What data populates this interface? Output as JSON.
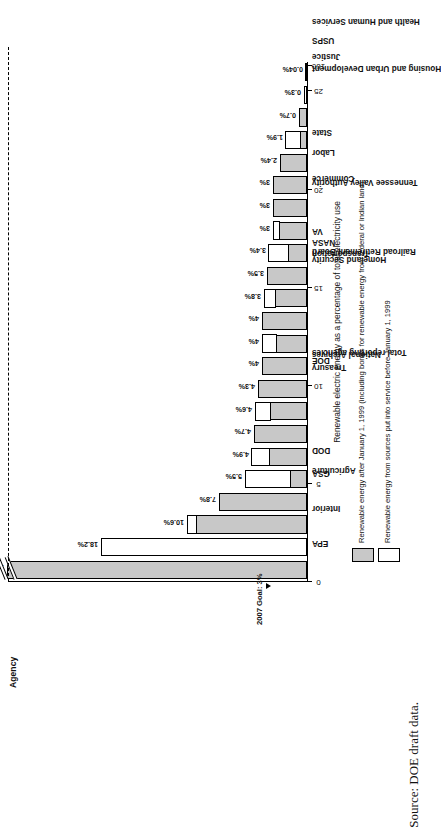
{
  "figure": {
    "source_caption": "Source: DOE draft data.",
    "axis_title_category": "Agency",
    "annotation": {
      "goal_label": "2007 Goal: 3%",
      "goal_value": 3
    }
  },
  "legend": {
    "items": [
      {
        "swatch": "gray",
        "label": "Renewable energy after January 1, 1999 (including bonus for renewable energy from federal or Indian land)"
      },
      {
        "swatch": "white",
        "label": "Renewable energy from sources put into service before January 1, 1999"
      }
    ]
  },
  "chart_data": {
    "type": "bar",
    "orientation": "vertical-rotated",
    "title": "",
    "xlabel": "Agency",
    "ylabel": "Renewable electric energy as a percentage of total electricity use",
    "ylim": [
      0,
      27
    ],
    "axis_break": {
      "present": true,
      "break_after": 26,
      "top_tick": 160
    },
    "tick_labels": [
      "0",
      "5",
      "10",
      "15",
      "20",
      "25",
      "160"
    ],
    "tick_values": [
      0,
      5,
      10,
      15,
      20,
      25,
      160
    ],
    "grid": false,
    "legend_position": "below-axis",
    "reference_line": {
      "value": 3,
      "label": "2007 Goal: 3%",
      "style": "dashed"
    },
    "categories": [
      "EPA",
      "Interior",
      "Agriculture",
      "GSA",
      "DOD",
      "Total reporting agencies",
      "National Archives",
      "Treasury",
      "DOE",
      "Railroad Retirement Board",
      "Homeland Security",
      "Transportation",
      "Tennessee Valley Authority",
      "NASA",
      "VA",
      "Commerce",
      "Housing and Urban Development",
      "Labor",
      "State",
      "Health and Human Services",
      "Social Security Administration",
      "Justice",
      "USPS"
    ],
    "value_labels": [
      "153.5%",
      "18.2%",
      "10.6%",
      "7.8%",
      "5.5%",
      "4.9%",
      "4.7%",
      "4.6%",
      "4.3%",
      "4%",
      "4%",
      "4%",
      "3.8%",
      "3.5%",
      "3.4%",
      "3%",
      "3%",
      "3%",
      "2.4%",
      "1.9%",
      "0.7%",
      "0.3%",
      "0.04%"
    ],
    "values": [
      153.5,
      18.2,
      10.6,
      7.8,
      5.5,
      4.9,
      4.7,
      4.6,
      4.3,
      4.0,
      4.0,
      4.0,
      3.8,
      3.5,
      3.4,
      3.0,
      3.0,
      3.0,
      2.4,
      1.9,
      0.7,
      0.3,
      0.04
    ],
    "series": [
      {
        "name": "Renewable energy after January 1, 1999 (including bonus for renewable energy from federal or Indian land)",
        "swatch": "gray",
        "values": [
          153.5,
          0.0,
          9.7,
          7.8,
          1.4,
          3.3,
          4.7,
          3.2,
          4.3,
          4.0,
          2.6,
          4.0,
          2.7,
          3.5,
          1.6,
          2.4,
          3.0,
          3.0,
          2.4,
          0.5,
          0.7,
          0.0,
          0.04
        ]
      },
      {
        "name": "Renewable energy from sources put into service before January 1, 1999",
        "swatch": "white",
        "values": [
          0.0,
          18.2,
          0.9,
          0.0,
          4.1,
          1.6,
          0.0,
          1.4,
          0.0,
          0.0,
          1.4,
          0.0,
          1.1,
          0.0,
          1.8,
          0.6,
          0.0,
          0.0,
          0.0,
          1.4,
          0.0,
          0.3,
          0.0
        ]
      }
    ]
  }
}
